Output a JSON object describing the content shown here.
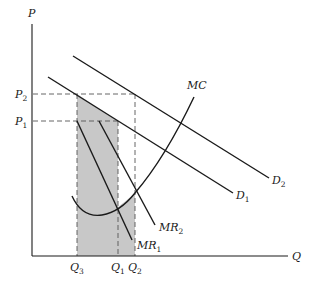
{
  "diagram": {
    "type": "economics-monopoly-price-quantity",
    "axes": {
      "y_label": "P",
      "x_label": "Q"
    },
    "price_labels": [
      {
        "main": "P",
        "sub": "2"
      },
      {
        "main": "P",
        "sub": "1"
      }
    ],
    "quantity_labels": [
      {
        "main": "Q",
        "sub": "3"
      },
      {
        "main": "Q",
        "sub": "1"
      },
      {
        "main": "Q",
        "sub": "2"
      }
    ],
    "curves": [
      {
        "id": "D2",
        "main": "D",
        "sub": "2"
      },
      {
        "id": "D1",
        "main": "D",
        "sub": "1"
      },
      {
        "id": "MC",
        "main": "MC",
        "sub": ""
      },
      {
        "id": "MR2",
        "main": "MR",
        "sub": "2"
      },
      {
        "id": "MR1",
        "main": "MR",
        "sub": "1"
      }
    ],
    "colors": {
      "line": "#1a1a1a",
      "shade": "#c8c8c8",
      "dash": "#555555"
    }
  }
}
